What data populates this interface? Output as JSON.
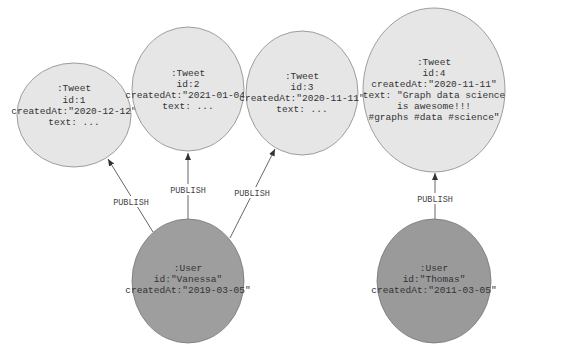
{
  "colors": {
    "tweet_fill": "#e6e6e6",
    "user_fill": "#9e9e9e",
    "stroke": "#777777",
    "edge": "#444444"
  },
  "nodes": {
    "tweet1": {
      "label": ":Tweet",
      "lines": [
        "id:1",
        "createdAt:\"2020-12-12\"",
        "text: ..."
      ]
    },
    "tweet2": {
      "label": ":Tweet",
      "lines": [
        "id:2",
        "createdAt:\"2021-01-04\"",
        "text: ..."
      ]
    },
    "tweet3": {
      "label": ":Tweet",
      "lines": [
        "id:3",
        "createdAt:\"2020-11-11\"",
        "text: ..."
      ]
    },
    "tweet4": {
      "label": ":Tweet",
      "lines": [
        "id:4",
        "createdAt:\"2020-11-11\"",
        "text: \"Graph data science",
        "is awesome!!!",
        "#graphs #data #science\""
      ]
    },
    "user_vanessa": {
      "label": ":User",
      "lines": [
        "id:\"Vanessa\"",
        "createdAt:\"2019-03-05\""
      ]
    },
    "user_thomas": {
      "label": ":User",
      "lines": [
        "id:\"Thomas\"",
        "createdAt:\"2011-03-05\""
      ]
    }
  },
  "edges": [
    {
      "from": "user_vanessa",
      "to": "tweet1",
      "label": "PUBLISH"
    },
    {
      "from": "user_vanessa",
      "to": "tweet2",
      "label": "PUBLISH"
    },
    {
      "from": "user_vanessa",
      "to": "tweet3",
      "label": "PUBLISH"
    },
    {
      "from": "user_thomas",
      "to": "tweet4",
      "label": "PUBLISH"
    }
  ]
}
